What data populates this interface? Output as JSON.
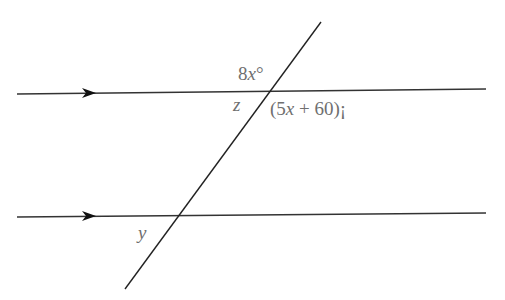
{
  "diagram": {
    "type": "parallel lines cut by a transversal",
    "lines": {
      "top_parallel": {
        "x1": 17,
        "y1": 94,
        "x2": 486,
        "y2": 89
      },
      "bottom_parallel": {
        "x1": 17,
        "y1": 217,
        "x2": 486,
        "y2": 213
      },
      "transversal": {
        "x1": 321,
        "y1": 22,
        "x2": 125,
        "y2": 289
      }
    },
    "arrows": [
      {
        "line": "top_parallel",
        "x": 92,
        "y": 93
      },
      {
        "line": "bottom_parallel",
        "x": 92,
        "y": 216
      }
    ],
    "labels": {
      "angle_top": {
        "coef": "8",
        "var": "x",
        "unit": "°"
      },
      "angle_z": "z",
      "angle_right": {
        "open": "(5",
        "var": "x",
        "rest": " + 60)¡"
      },
      "angle_y": "y"
    },
    "colors": {
      "line": "#222222",
      "label": "#6f6f6f"
    }
  }
}
